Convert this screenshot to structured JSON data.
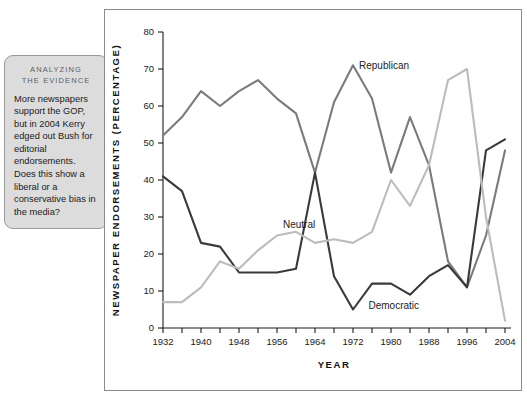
{
  "annotation": {
    "title_line1": "ANALYZING",
    "title_line2": "THE EVIDENCE",
    "body": "More newspapers support the GOP, but in 2004 Kerry edged out Bush for editorial endorsements. Does this show a liberal or a conservative bias in the media?"
  },
  "chart_data": {
    "type": "line",
    "title": "",
    "xlabel": "YEAR",
    "ylabel": "NEWSPAPER ENDORSEMENTS (PERCENTAGE)",
    "xlim": [
      1932,
      2004
    ],
    "ylim": [
      0,
      80
    ],
    "ytick_step": 10,
    "yticks": [
      0,
      10,
      20,
      30,
      40,
      50,
      60,
      70,
      80
    ],
    "xticks": [
      1932,
      1936,
      1940,
      1944,
      1948,
      1952,
      1956,
      1960,
      1964,
      1968,
      1972,
      1976,
      1980,
      1984,
      1988,
      1992,
      1996,
      2000,
      2004
    ],
    "xtick_labels": [
      "1932",
      "",
      "1940",
      "",
      "1948",
      "",
      "1956",
      "",
      "1964",
      "",
      "1972",
      "",
      "1980",
      "",
      "1988",
      "",
      "1996",
      "",
      "2004"
    ],
    "grid": false,
    "legend_position": "inline-annotations",
    "x": [
      1932,
      1936,
      1940,
      1944,
      1948,
      1952,
      1956,
      1960,
      1964,
      1968,
      1972,
      1976,
      1980,
      1984,
      1988,
      1992,
      1996,
      2000,
      2004
    ],
    "series": [
      {
        "name": "Republican",
        "color": "#7b7b7b",
        "label_x": 1972,
        "label_y": 71,
        "values": [
          52,
          57,
          64,
          60,
          64,
          67,
          62,
          58,
          42,
          61,
          71,
          62,
          42,
          57,
          44,
          18,
          11,
          25,
          48
        ]
      },
      {
        "name": "Democratic",
        "color": "#3a3a3a",
        "label_x": 1974,
        "label_y": 6,
        "values": [
          41,
          37,
          23,
          22,
          15,
          15,
          15,
          16,
          42,
          14,
          5,
          12,
          12,
          9,
          14,
          17,
          11,
          48,
          51
        ]
      },
      {
        "name": "Neutral",
        "color": "#bcbcbc",
        "label_x": 1956,
        "label_y": 28,
        "values": [
          7,
          7,
          11,
          18,
          16,
          21,
          25,
          26,
          23,
          24,
          23,
          26,
          40,
          33,
          44,
          67,
          70,
          30,
          2
        ]
      }
    ]
  }
}
